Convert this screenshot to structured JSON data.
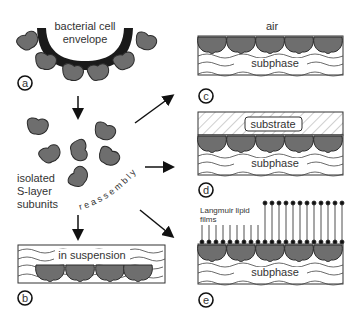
{
  "figure": {
    "panels": {
      "a": {
        "label": "a",
        "text_line1": "bacterial cell",
        "text_line2": "envelope"
      },
      "isolated": {
        "line1": "isolated",
        "line2": "S-layer",
        "line3": "subunits"
      },
      "reassembly": {
        "text": "reassembly"
      },
      "b": {
        "label": "b",
        "text": "in suspension"
      },
      "c": {
        "label": "c",
        "top_text": "air",
        "text": "subphase"
      },
      "d": {
        "label": "d",
        "substrate": "substrate",
        "text": "subphase"
      },
      "e": {
        "label": "e",
        "films_line1": "Langmuir lipid",
        "films_line2": "films",
        "text": "subphase"
      }
    },
    "colors": {
      "subunit_fill": "#6e6e6e",
      "subunit_stroke": "#2a2a2a",
      "envelope": "#1a1a1a",
      "line": "#222222"
    }
  }
}
